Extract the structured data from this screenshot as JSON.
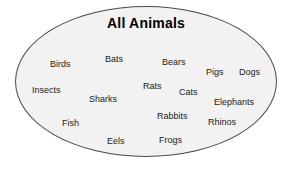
{
  "diagram": {
    "type": "venn-single-set",
    "title": "All Animals",
    "shape": "ellipse",
    "colors": {
      "background": "#ffffff",
      "set_fill": "#f2f2f2",
      "set_border": "#4a4a4a",
      "text": "#1a1a1a",
      "title_text": "#000000"
    },
    "members": [
      {
        "label": "Birds",
        "x": 50,
        "y": 59
      },
      {
        "label": "Bats",
        "x": 105,
        "y": 54
      },
      {
        "label": "Bears",
        "x": 162,
        "y": 57
      },
      {
        "label": "Pigs",
        "x": 206,
        "y": 67
      },
      {
        "label": "Dogs",
        "x": 239,
        "y": 67
      },
      {
        "label": "Insects",
        "x": 32,
        "y": 85
      },
      {
        "label": "Rats",
        "x": 143,
        "y": 81
      },
      {
        "label": "Cats",
        "x": 179,
        "y": 87
      },
      {
        "label": "Sharks",
        "x": 89,
        "y": 94
      },
      {
        "label": "Elephants",
        "x": 214,
        "y": 97
      },
      {
        "label": "Rabbits",
        "x": 157,
        "y": 111
      },
      {
        "label": "Fish",
        "x": 62,
        "y": 118
      },
      {
        "label": "Rhinos",
        "x": 208,
        "y": 117
      },
      {
        "label": "Eels",
        "x": 107,
        "y": 136
      },
      {
        "label": "Frogs",
        "x": 159,
        "y": 135
      }
    ]
  }
}
